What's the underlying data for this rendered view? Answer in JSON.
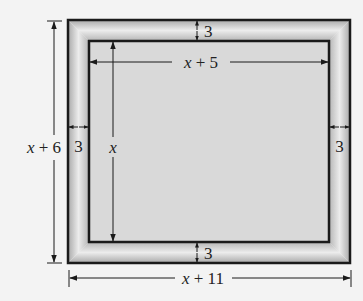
{
  "diagram": {
    "outer_width_label": "x + 11",
    "outer_height_label": "x + 6",
    "inner_width_label": "x + 5",
    "inner_height_label": "x",
    "frame_widths": {
      "top": "3",
      "bottom": "3",
      "left": "3",
      "right": "3"
    },
    "colors": {
      "background": "#f3f3f3",
      "frame_light": "#ebebeb",
      "frame_dark": "#a8a8a8",
      "inner": "#d9d9d9",
      "stroke": "#1a1a1a"
    }
  }
}
